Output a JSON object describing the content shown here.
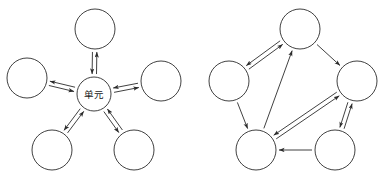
{
  "figure": {
    "background_color": "#ffffff",
    "stroke_color": "#2b2b2b",
    "label_color": "#1a1a1a",
    "width": 389,
    "height": 181
  },
  "diagrams": [
    {
      "id": "star-topology",
      "name": "star-topology-diagram",
      "topology": "star",
      "center_node": {
        "id": "center",
        "label": "单元",
        "cx": 94,
        "cy": 94,
        "r": 17
      },
      "nodes": [
        {
          "id": "top",
          "label": "",
          "cx": 95,
          "cy": 29,
          "r": 20
        },
        {
          "id": "left",
          "label": "",
          "cx": 27,
          "cy": 78,
          "r": 20
        },
        {
          "id": "right",
          "label": "",
          "cx": 161,
          "cy": 81,
          "r": 20
        },
        {
          "id": "bottom-left",
          "label": "",
          "cx": 52,
          "cy": 150,
          "r": 20
        },
        {
          "id": "bottom-right",
          "label": "",
          "cx": 134,
          "cy": 150,
          "r": 20
        }
      ],
      "edges": [
        {
          "from": "center",
          "to": "top",
          "direction": "bidirectional"
        },
        {
          "from": "center",
          "to": "left",
          "direction": "bidirectional"
        },
        {
          "from": "center",
          "to": "right",
          "direction": "bidirectional"
        },
        {
          "from": "center",
          "to": "bottom-left",
          "direction": "bidirectional"
        },
        {
          "from": "center",
          "to": "bottom-right",
          "direction": "bidirectional"
        }
      ]
    },
    {
      "id": "mesh-topology",
      "name": "mesh-topology-diagram",
      "topology": "mesh",
      "center_node": null,
      "nodes": [
        {
          "id": "top",
          "label": "",
          "cx": 300,
          "cy": 29,
          "r": 20
        },
        {
          "id": "upper-left",
          "label": "",
          "cx": 229,
          "cy": 81,
          "r": 20
        },
        {
          "id": "right",
          "label": "",
          "cx": 357,
          "cy": 81,
          "r": 20
        },
        {
          "id": "bottom-left",
          "label": "",
          "cx": 256,
          "cy": 150,
          "r": 20
        },
        {
          "id": "bottom-right",
          "label": "",
          "cx": 335,
          "cy": 150,
          "r": 20
        }
      ],
      "edges": [
        {
          "from": "upper-left",
          "to": "top",
          "direction": "bidirectional"
        },
        {
          "from": "top",
          "to": "right",
          "direction": "forward"
        },
        {
          "from": "upper-left",
          "to": "bottom-left",
          "direction": "forward"
        },
        {
          "from": "bottom-left",
          "to": "top",
          "direction": "forward"
        },
        {
          "from": "bottom-left",
          "to": "right",
          "direction": "bidirectional"
        },
        {
          "from": "right",
          "to": "bottom-right",
          "direction": "bidirectional"
        },
        {
          "from": "bottom-right",
          "to": "bottom-left",
          "direction": "forward"
        }
      ]
    }
  ]
}
